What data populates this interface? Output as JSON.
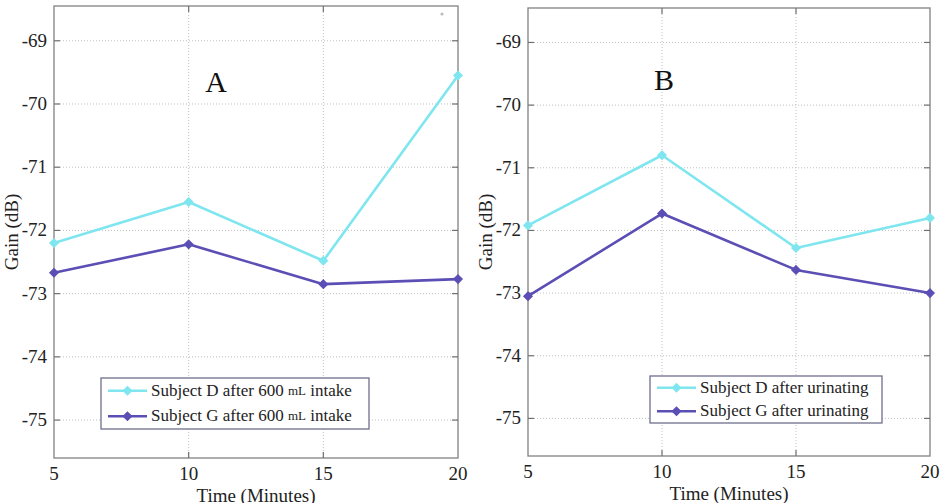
{
  "figure": {
    "background_color": "#ffffff",
    "axis_color": "#8a8a8a",
    "grid_color": "#b9b9b9"
  },
  "chart_data": [
    {
      "type": "line",
      "panel_label": "A",
      "title": "",
      "xlabel": "Time (Minutes)",
      "ylabel": "Gain (dB)",
      "x": [
        5,
        10,
        15,
        20
      ],
      "xticks": [
        5,
        10,
        15,
        20
      ],
      "xtick_labels": [
        "5",
        "10",
        "15",
        "20"
      ],
      "xlim": [
        5,
        20
      ],
      "yticks": [
        -69,
        -70,
        -71,
        -72,
        -73,
        -74,
        -75
      ],
      "ytick_labels": [
        "-69",
        "-70",
        "-71",
        "-72",
        "-73",
        "-74",
        "-75"
      ],
      "ylim": [
        -75.6,
        -68.45
      ],
      "grid": true,
      "legend_position": "lower center",
      "series": [
        {
          "name": "Subject D after 600 mL intake",
          "name_main": "Subject D after 600",
          "name_unit": "mL",
          "name_tail": "intake",
          "color": "#7fe6ef",
          "marker": "diamond",
          "values": [
            -72.2,
            -71.55,
            -72.48,
            -69.55
          ]
        },
        {
          "name": "Subject G after 600 mL intake",
          "name_main": "Subject G after 600",
          "name_unit": "mL",
          "name_tail": "intake",
          "color": "#5b4fb5",
          "marker": "diamond",
          "values": [
            -72.67,
            -72.22,
            -72.85,
            -72.77
          ]
        }
      ]
    },
    {
      "type": "line",
      "panel_label": "B",
      "title": "",
      "xlabel": "Time (Minutes)",
      "ylabel": "Gain (dB)",
      "x": [
        5,
        10,
        15,
        20
      ],
      "xticks": [
        5,
        10,
        15,
        20
      ],
      "xtick_labels": [
        "5",
        "10",
        "15",
        "20"
      ],
      "xlim": [
        5,
        20
      ],
      "yticks": [
        -69,
        -70,
        -71,
        -72,
        -73,
        -74,
        -75
      ],
      "ytick_labels": [
        "-69",
        "-70",
        "-71",
        "-72",
        "-73",
        "-74",
        "-75"
      ],
      "ylim": [
        -75.6,
        -68.45
      ],
      "grid": true,
      "legend_position": "lower center",
      "series": [
        {
          "name": "Subject D after urinating",
          "name_main": "Subject D after urinating",
          "name_unit": "",
          "name_tail": "",
          "color": "#7fe6ef",
          "marker": "diamond",
          "values": [
            -71.92,
            -70.8,
            -72.28,
            -71.8
          ]
        },
        {
          "name": "Subject G after urinating",
          "name_main": "Subject G after urinating",
          "name_unit": "",
          "name_tail": "",
          "color": "#5b4fb5",
          "marker": "diamond",
          "values": [
            -73.05,
            -71.73,
            -72.63,
            -73.0
          ]
        }
      ]
    }
  ],
  "layout": {
    "panels": [
      {
        "id": "panel-a",
        "plot_left": 54,
        "plot_right": 458,
        "plot_top": 6,
        "plot_bottom": 458,
        "letter_x": 216,
        "letter_y": 92,
        "legend_x": 101,
        "legend_y": 378,
        "legend_w": 268,
        "legend_h": 51,
        "speck": {
          "x": 442,
          "y": 14,
          "r": 1.6
        }
      },
      {
        "id": "panel-b",
        "plot_left": 56,
        "plot_right": 458,
        "plot_top": 8,
        "plot_bottom": 456,
        "letter_x": 192,
        "letter_y": 90,
        "legend_x": 178,
        "legend_y": 376,
        "legend_w": 232,
        "legend_h": 47,
        "speck": null
      }
    ]
  }
}
